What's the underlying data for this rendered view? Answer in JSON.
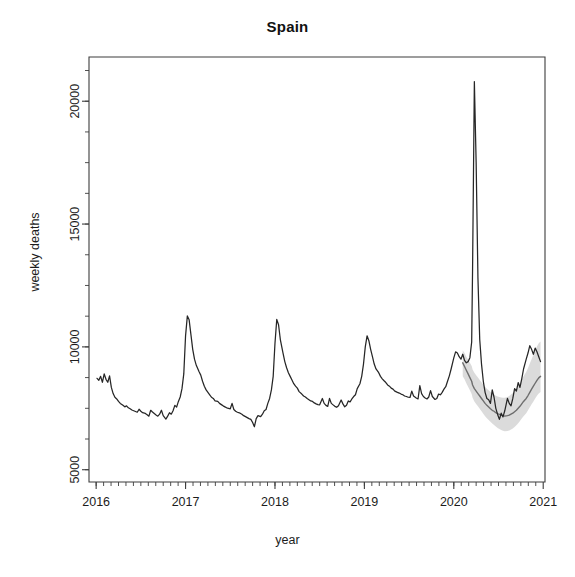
{
  "chart_data": {
    "type": "line",
    "title": "Spain",
    "xlabel": "year",
    "ylabel": "weekly deaths",
    "grid": false,
    "legend": "none",
    "xlim": [
      2015.92,
      2021.02
    ],
    "ylim": [
      4500,
      21800
    ],
    "x_ticks": [
      "2016",
      "2017",
      "2018",
      "2019",
      "2020",
      "2021"
    ],
    "x_tick_values": [
      2016,
      2017,
      2018,
      2019,
      2020,
      2021
    ],
    "x_minor_ticks_per_year": 12,
    "y_ticks": [
      "5000",
      "10000",
      "15000",
      "20000"
    ],
    "y_tick_values": [
      5000,
      10000,
      15000,
      20000
    ],
    "y_minor_tick_step": 1250,
    "series": [
      {
        "name": "observed weekly deaths",
        "color": "#262626",
        "style": "solid",
        "x": [
          2016.01,
          2016.03,
          2016.05,
          2016.07,
          2016.09,
          2016.11,
          2016.13,
          2016.15,
          2016.17,
          2016.19,
          2016.21,
          2016.23,
          2016.25,
          2016.27,
          2016.3,
          2016.32,
          2016.34,
          2016.36,
          2016.38,
          2016.4,
          2016.42,
          2016.44,
          2016.46,
          2016.48,
          2016.5,
          2016.52,
          2016.55,
          2016.57,
          2016.59,
          2016.61,
          2016.63,
          2016.65,
          2016.67,
          2016.69,
          2016.71,
          2016.73,
          2016.75,
          2016.78,
          2016.8,
          2016.82,
          2016.84,
          2016.86,
          2016.88,
          2016.9,
          2016.92,
          2016.94,
          2016.96,
          2016.98,
          2017.0,
          2017.02,
          2017.04,
          2017.06,
          2017.08,
          2017.1,
          2017.12,
          2017.15,
          2017.17,
          2017.19,
          2017.21,
          2017.23,
          2017.25,
          2017.27,
          2017.29,
          2017.31,
          2017.33,
          2017.36,
          2017.38,
          2017.4,
          2017.42,
          2017.44,
          2017.46,
          2017.48,
          2017.5,
          2017.52,
          2017.54,
          2017.56,
          2017.58,
          2017.61,
          2017.63,
          2017.65,
          2017.67,
          2017.69,
          2017.71,
          2017.73,
          2017.75,
          2017.77,
          2017.79,
          2017.81,
          2017.84,
          2017.86,
          2017.88,
          2017.9,
          2017.92,
          2017.94,
          2017.96,
          2017.98,
          2018.0,
          2018.02,
          2018.04,
          2018.06,
          2018.09,
          2018.11,
          2018.13,
          2018.15,
          2018.17,
          2018.19,
          2018.21,
          2018.23,
          2018.25,
          2018.27,
          2018.3,
          2018.32,
          2018.34,
          2018.36,
          2018.38,
          2018.4,
          2018.42,
          2018.44,
          2018.46,
          2018.48,
          2018.5,
          2018.53,
          2018.55,
          2018.57,
          2018.59,
          2018.61,
          2018.63,
          2018.65,
          2018.67,
          2018.69,
          2018.71,
          2018.74,
          2018.76,
          2018.78,
          2018.8,
          2018.82,
          2018.84,
          2018.86,
          2018.88,
          2018.9,
          2018.92,
          2018.95,
          2018.97,
          2018.99,
          2019.01,
          2019.03,
          2019.05,
          2019.07,
          2019.09,
          2019.11,
          2019.13,
          2019.16,
          2019.18,
          2019.2,
          2019.22,
          2019.24,
          2019.26,
          2019.28,
          2019.3,
          2019.32,
          2019.34,
          2019.37,
          2019.39,
          2019.41,
          2019.43,
          2019.45,
          2019.47,
          2019.49,
          2019.51,
          2019.53,
          2019.55,
          2019.58,
          2019.6,
          2019.62,
          2019.64,
          2019.66,
          2019.68,
          2019.7,
          2019.72,
          2019.74,
          2019.76,
          2019.79,
          2019.81,
          2019.83,
          2019.85,
          2019.87,
          2019.89,
          2019.91,
          2019.93,
          2019.95,
          2019.97,
          2020.0,
          2020.02,
          2020.04,
          2020.06,
          2020.08,
          2020.1,
          2020.12,
          2020.14,
          2020.16,
          2020.18,
          2020.2,
          2020.21,
          2020.23,
          2020.25,
          2020.27,
          2020.29,
          2020.31,
          2020.33,
          2020.35,
          2020.37,
          2020.39,
          2020.41,
          2020.43,
          2020.45,
          2020.47,
          2020.49,
          2020.51,
          2020.53,
          2020.55,
          2020.57,
          2020.6,
          2020.62,
          2020.64,
          2020.66,
          2020.68,
          2020.7,
          2020.72,
          2020.74,
          2020.76,
          2020.78,
          2020.81,
          2020.83,
          2020.85,
          2020.87,
          2020.89,
          2020.91,
          2020.93,
          2020.95,
          2020.97
        ],
        "y": [
          8720,
          8640,
          8800,
          8560,
          8900,
          8680,
          8560,
          8820,
          8350,
          8100,
          7950,
          7880,
          7780,
          7700,
          7620,
          7560,
          7600,
          7520,
          7480,
          7430,
          7400,
          7370,
          7340,
          7460,
          7380,
          7320,
          7290,
          7240,
          7180,
          7420,
          7350,
          7290,
          7230,
          7180,
          7260,
          7420,
          7200,
          7060,
          7180,
          7320,
          7260,
          7400,
          7620,
          7550,
          7780,
          7960,
          8300,
          8900,
          10450,
          11260,
          11100,
          10500,
          9900,
          9500,
          9250,
          9000,
          8850,
          8600,
          8400,
          8250,
          8150,
          8050,
          7950,
          7900,
          7800,
          7780,
          7700,
          7650,
          7600,
          7560,
          7520,
          7500,
          7480,
          7700,
          7450,
          7380,
          7340,
          7300,
          7260,
          7200,
          7160,
          7120,
          7080,
          7050,
          6920,
          6750,
          7080,
          7200,
          7160,
          7260,
          7400,
          7450,
          7700,
          7900,
          8250,
          8800,
          10150,
          11120,
          10900,
          10300,
          9750,
          9400,
          9150,
          8950,
          8800,
          8650,
          8500,
          8400,
          8320,
          8180,
          8080,
          8000,
          7960,
          7900,
          7850,
          7800,
          7780,
          7720,
          7680,
          7650,
          7640,
          7900,
          7700,
          7620,
          7580,
          7900,
          7700,
          7640,
          7580,
          7540,
          7600,
          7840,
          7680,
          7560,
          7620,
          7800,
          7760,
          7880,
          7980,
          8050,
          8300,
          8500,
          8800,
          9300,
          10000,
          10450,
          10250,
          9900,
          9600,
          9300,
          9100,
          8950,
          8800,
          8700,
          8620,
          8550,
          8450,
          8400,
          8320,
          8280,
          8200,
          8150,
          8120,
          8080,
          8050,
          8000,
          7980,
          7950,
          7940,
          8200,
          8000,
          7920,
          7880,
          8420,
          8100,
          7980,
          7920,
          7880,
          7960,
          8220,
          7980,
          7860,
          7900,
          8080,
          8050,
          8150,
          8280,
          8380,
          8600,
          8820,
          9100,
          9550,
          9800,
          9750,
          9600,
          9500,
          9700,
          9450,
          9350,
          9400,
          9560,
          10200,
          13200,
          20800,
          17500,
          12800,
          10300,
          9300,
          8600,
          8150,
          7900,
          7850,
          7700,
          8250,
          7950,
          7500,
          7250,
          7050,
          7300,
          7150,
          7400,
          7900,
          7700,
          7600,
          7900,
          8300,
          8200,
          8550,
          8350,
          8700,
          9100,
          9500,
          9750,
          10050,
          9900,
          9700,
          9950,
          9800,
          9600,
          9400
        ]
      },
      {
        "name": "expected (model) weekly deaths",
        "color": "#6e6e6e",
        "style": "solid",
        "x": [
          2020.1,
          2020.12,
          2020.14,
          2020.16,
          2020.18,
          2020.2,
          2020.21,
          2020.23,
          2020.25,
          2020.27,
          2020.29,
          2020.31,
          2020.33,
          2020.35,
          2020.37,
          2020.39,
          2020.41,
          2020.43,
          2020.45,
          2020.47,
          2020.49,
          2020.51,
          2020.53,
          2020.55,
          2020.57,
          2020.6,
          2020.62,
          2020.64,
          2020.66,
          2020.68,
          2020.7,
          2020.72,
          2020.74,
          2020.76,
          2020.78,
          2020.81,
          2020.83,
          2020.85,
          2020.87,
          2020.89,
          2020.91,
          2020.93,
          2020.95,
          2020.97
        ],
        "y": [
          9350,
          9200,
          9050,
          8900,
          8750,
          8600,
          8450,
          8300,
          8200,
          8100,
          8000,
          7900,
          7800,
          7700,
          7620,
          7550,
          7480,
          7420,
          7380,
          7320,
          7280,
          7250,
          7220,
          7200,
          7180,
          7200,
          7220,
          7260,
          7300,
          7360,
          7420,
          7500,
          7580,
          7680,
          7780,
          7900,
          8020,
          8150,
          8280,
          8400,
          8520,
          8640,
          8740,
          8800
        ]
      }
    ],
    "band": {
      "name": "prediction interval",
      "color": "#d4d4d4",
      "x": [
        2020.1,
        2020.12,
        2020.14,
        2020.16,
        2020.18,
        2020.2,
        2020.21,
        2020.23,
        2020.25,
        2020.27,
        2020.29,
        2020.31,
        2020.33,
        2020.35,
        2020.37,
        2020.39,
        2020.41,
        2020.43,
        2020.45,
        2020.47,
        2020.49,
        2020.51,
        2020.53,
        2020.55,
        2020.57,
        2020.6,
        2020.62,
        2020.64,
        2020.66,
        2020.68,
        2020.7,
        2020.72,
        2020.74,
        2020.76,
        2020.78,
        2020.81,
        2020.83,
        2020.85,
        2020.87,
        2020.89,
        2020.91,
        2020.93,
        2020.95,
        2020.97
      ],
      "upper": [
        9850,
        9750,
        9600,
        9480,
        9350,
        9220,
        9080,
        8950,
        8850,
        8750,
        8650,
        8560,
        8470,
        8380,
        8300,
        8230,
        8160,
        8100,
        8060,
        8010,
        7980,
        7960,
        7940,
        7930,
        7930,
        7960,
        8000,
        8060,
        8120,
        8200,
        8290,
        8400,
        8520,
        8660,
        8800,
        8980,
        9140,
        9320,
        9500,
        9680,
        9860,
        10020,
        10150,
        10220
      ],
      "lower": [
        8800,
        8680,
        8520,
        8380,
        8230,
        8080,
        7930,
        7780,
        7680,
        7580,
        7480,
        7380,
        7280,
        7180,
        7100,
        7020,
        6950,
        6880,
        6820,
        6760,
        6700,
        6660,
        6620,
        6590,
        6570,
        6580,
        6600,
        6640,
        6680,
        6740,
        6810,
        6890,
        6980,
        7080,
        7180,
        7300,
        7420,
        7540,
        7660,
        7780,
        7900,
        8010,
        8100,
        8160
      ]
    },
    "annotations": {
      "covid_peak_value": 20800,
      "covid_peak_x": 2020.23,
      "winter_peak_2017": 11260,
      "winter_peak_2018": 11120,
      "winter_peak_2019": 10450,
      "summer_trough_typical": 7000
    }
  },
  "axes": {
    "title": "Spain",
    "y_axis_label": "weekly deaths",
    "x_axis_label": "year",
    "box_color": "#3a3a3a"
  }
}
